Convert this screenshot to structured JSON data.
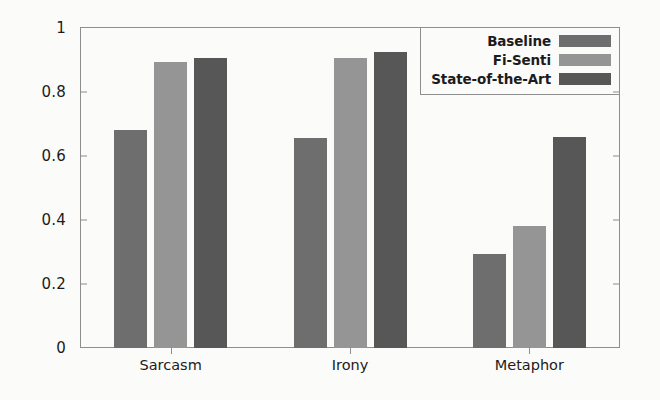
{
  "chart_data": {
    "type": "bar",
    "title": "",
    "subtitle": "",
    "xlabel": "",
    "ylabel": "",
    "categories": [
      "Sarcasm",
      "Irony",
      "Metaphor"
    ],
    "series": [
      {
        "name": "Baseline",
        "values": [
          0.68,
          0.655,
          0.295
        ],
        "color": "#6e6e6e"
      },
      {
        "name": "Fi-Senti",
        "values": [
          0.895,
          0.905,
          0.38
        ],
        "color": "#959595"
      },
      {
        "name": "State-of-the-Art",
        "values": [
          0.905,
          0.925,
          0.66
        ],
        "color": "#575757"
      }
    ],
    "ylim": [
      0,
      1
    ],
    "yticks": [
      "0",
      "0.2",
      "0.4",
      "0.6",
      "0.8",
      "1"
    ],
    "ytick_values": [
      0,
      0.2,
      0.4,
      0.6,
      0.8,
      1
    ],
    "grid": false,
    "legend_position": "top-right",
    "legend_entries": [
      "Baseline",
      "Fi-Senti",
      "State-of-the-Art"
    ]
  },
  "axes": {
    "y_tick_labels": [
      "1",
      "0.8",
      "0.6",
      "0.4",
      "0.2",
      "0"
    ],
    "x_tick_labels": [
      "Sarcasm",
      "Irony",
      "Metaphor"
    ]
  },
  "legend": {
    "items": [
      {
        "label": "Baseline",
        "color": "#6e6e6e"
      },
      {
        "label": "Fi-Senti",
        "color": "#959595"
      },
      {
        "label": "State-of-the-Art",
        "color": "#575757"
      }
    ]
  }
}
